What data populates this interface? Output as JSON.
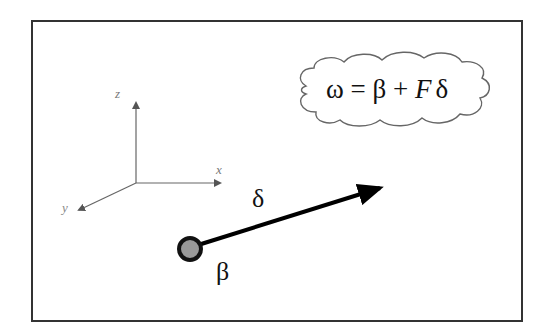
{
  "figure": {
    "equation": {
      "omega": "ω",
      "equals": "=",
      "beta": "β",
      "plus": "+",
      "F": "F",
      "delta": "δ"
    },
    "axes": {
      "x_label": "x",
      "y_label": "y",
      "z_label": "z"
    },
    "vector_label": "δ",
    "point_label": "β",
    "colors": {
      "frame": "#333333",
      "axes": "#666666",
      "vector": "#000000",
      "point_fill": "#999999",
      "cloud_stroke": "#666666"
    }
  }
}
